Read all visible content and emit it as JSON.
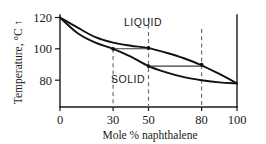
{
  "chart_data": {
    "type": "line",
    "title": "",
    "xlabel": "Mole % naphthalene",
    "ylabel": "Temperature, °C ↑",
    "xlim": [
      0,
      100
    ],
    "ylim": [
      70,
      124
    ],
    "grid": false,
    "legend": "none",
    "x_ticks": [
      "0",
      "30",
      "50",
      "80",
      "100"
    ],
    "x_tick_values": [
      0,
      30,
      50,
      80,
      100
    ],
    "y_ticks": [
      "120",
      "100",
      "80"
    ],
    "y_tick_values": [
      120,
      100,
      80
    ],
    "series": [
      {
        "name": "liquidus",
        "points": [
          {
            "x": 0,
            "y": 120
          },
          {
            "x": 10,
            "y": 113.5
          },
          {
            "x": 20,
            "y": 107.5
          },
          {
            "x": 30,
            "y": 104
          },
          {
            "x": 40,
            "y": 102
          },
          {
            "x": 50,
            "y": 100.5
          },
          {
            "x": 60,
            "y": 97.5
          },
          {
            "x": 70,
            "y": 94
          },
          {
            "x": 80,
            "y": 89.5
          },
          {
            "x": 90,
            "y": 84
          },
          {
            "x": 100,
            "y": 78
          }
        ]
      },
      {
        "name": "solidus",
        "points": [
          {
            "x": 0,
            "y": 120
          },
          {
            "x": 10,
            "y": 110
          },
          {
            "x": 20,
            "y": 104
          },
          {
            "x": 30,
            "y": 100
          },
          {
            "x": 40,
            "y": 95
          },
          {
            "x": 50,
            "y": 89
          },
          {
            "x": 60,
            "y": 85
          },
          {
            "x": 70,
            "y": 82
          },
          {
            "x": 80,
            "y": 80
          },
          {
            "x": 90,
            "y": 78.6
          },
          {
            "x": 100,
            "y": 78
          }
        ]
      }
    ],
    "region_labels": [
      {
        "name": "LIQUID",
        "x": 47,
        "y": 113
      },
      {
        "name": "SOLID",
        "x": 38,
        "y": 92
      }
    ],
    "tie_lines": [
      {
        "name": "tie-line-upper",
        "temperature": 100,
        "x_left": 30,
        "x_right": 50
      },
      {
        "name": "tie-line-lower",
        "temperature": 89,
        "x_left": 50,
        "x_right": 80
      }
    ],
    "dashed_verticals": [
      30,
      50,
      80
    ],
    "markers": [
      {
        "x": 30,
        "y": 100
      },
      {
        "x": 50,
        "y": 100.5
      },
      {
        "x": 50,
        "y": 89
      },
      {
        "x": 80,
        "y": 89.5
      }
    ],
    "annotations": []
  }
}
